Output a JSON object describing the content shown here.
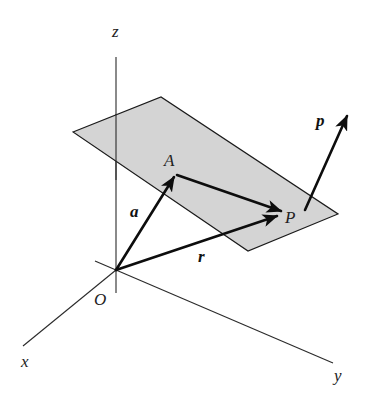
{
  "diagram": {
    "colors": {
      "plane_fill": "#d4d4d4",
      "lines": "#0d0d0d",
      "background": "#ffffff"
    },
    "axes": {
      "x": {
        "label": "x"
      },
      "y": {
        "label": "y"
      },
      "z": {
        "label": "z"
      }
    },
    "points": {
      "origin": {
        "label": "O"
      },
      "A": {
        "label": "A"
      },
      "P": {
        "label": "P"
      }
    },
    "vectors": {
      "a": {
        "label": "a",
        "from": "O",
        "to": "A"
      },
      "r": {
        "label": "r",
        "from": "O",
        "to": "P"
      },
      "AP": {
        "label": "",
        "from": "A",
        "to": "P"
      },
      "p": {
        "label": "p",
        "from": "P",
        "direction": "normal to plane"
      }
    },
    "plane": {
      "label": ""
    }
  }
}
